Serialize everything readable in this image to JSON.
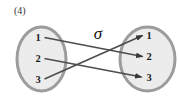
{
  "figure_label": "(4)",
  "diagram": {
    "map_symbol": "σ",
    "left_set": [
      "1",
      "2",
      "3"
    ],
    "right_set": [
      "1",
      "2",
      "3"
    ],
    "mapping": [
      {
        "from": "1",
        "to": "2"
      },
      {
        "from": "2",
        "to": "3"
      },
      {
        "from": "3",
        "to": "1"
      }
    ]
  },
  "colors": {
    "background": "#ffffff",
    "ellipse_fill": "#ececec",
    "ellipse_border": "#9c9c9c",
    "arrow": "#4d4d4d",
    "arrow_head": "#383838",
    "text": "#1c1c1c"
  }
}
